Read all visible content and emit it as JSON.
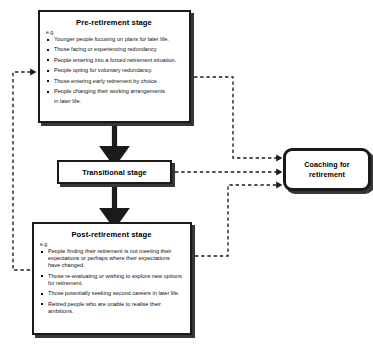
{
  "diagram": {
    "nodes": {
      "pre_retirement": {
        "title": "Pre-retirement stage",
        "eg": "e.g.",
        "bullets": [
          "Younger people focusing on plans for later life.",
          "Those facing or experiencing redundancy.",
          "People entering into a forced retirement situation.",
          "People opting for voluntary redundancy.",
          "Those entering early retirement by choice.",
          "People changing their working arrangements",
          "in later life."
        ]
      },
      "transitional": {
        "title": "Transitional stage"
      },
      "post_retirement": {
        "title": "Post-retirement stage",
        "eg": "e.g.",
        "bullets": [
          "People finding their retirement is not meeting their expectations or perhaps where their expectations have changed.",
          "Those re-evaluating or wishing to explore new options for retirement.",
          "Those potentially seeking second careers in later life.",
          "Retired people who are unable to realise their ambitions."
        ]
      },
      "coaching": {
        "title_line1": "Coaching for",
        "title_line2": "retirement"
      }
    },
    "connectors": [
      {
        "name": "pre-to-transitional-arrow",
        "style": "solid-thick",
        "from": "pre_retirement",
        "to": "transitional"
      },
      {
        "name": "transitional-to-post-arrow",
        "style": "solid-thick",
        "from": "transitional",
        "to": "post_retirement"
      },
      {
        "name": "pre-to-coaching-arrow",
        "style": "dashed",
        "from": "pre_retirement",
        "to": "coaching"
      },
      {
        "name": "transitional-to-coaching-arrow",
        "style": "dashed",
        "from": "transitional",
        "to": "coaching"
      },
      {
        "name": "post-to-coaching-arrow",
        "style": "dashed",
        "from": "post_retirement",
        "to": "coaching"
      },
      {
        "name": "post-to-pre-feedback-arrow",
        "style": "dashed",
        "from": "post_retirement",
        "to": "pre_retirement"
      }
    ],
    "colors": {
      "stroke": "#1a1a1a",
      "background": "#ffffff",
      "text": "#111111"
    }
  }
}
